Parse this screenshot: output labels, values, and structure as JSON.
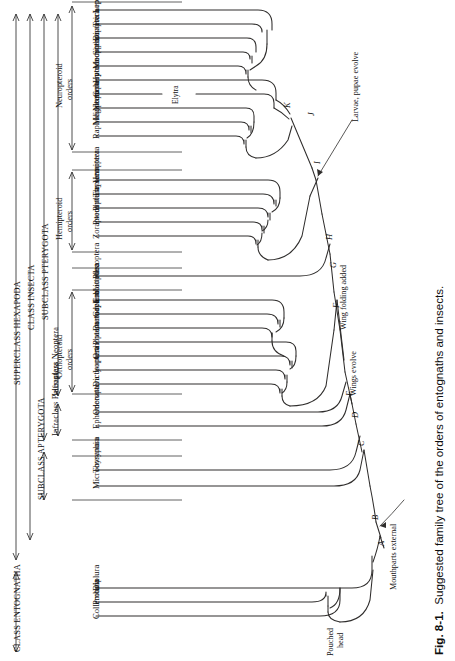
{
  "figure": {
    "label": "Fig. 8-1.",
    "caption": "Suggested family tree of the orders of entognaths and insects.",
    "caption_full": "Fig. 8-1.  Suggested family tree of the orders of entognaths and insects."
  },
  "diagram": {
    "type": "phylogenetic-tree",
    "orientation": "tips-at-left, root-at-bottom-right",
    "line_color": "#2b2b2b",
    "background": "#ffffff"
  },
  "taxonomy_brackets": [
    {
      "id": "superclass-hexapoda",
      "label": "SUPERCLASS HEXAPODA",
      "level": "superclass",
      "column": 1
    },
    {
      "id": "class-insecta",
      "label": "CLASS INSECTA",
      "level": "class",
      "column": 2
    },
    {
      "id": "subclass-pterygota",
      "label": "SUBCLASS PTERYGOTA",
      "level": "subclass",
      "column": 3
    },
    {
      "id": "subclass-apterygota",
      "label": "SUBCLASS APTERYGOTA",
      "level": "subclass",
      "column": 3,
      "two_line": true
    },
    {
      "id": "class-entognatha",
      "label": "CLASS ENTOGNATHA",
      "level": "class",
      "column": 1
    },
    {
      "id": "infraclass-neoptera",
      "label": "Infraclass Neoptera",
      "level": "infraclass",
      "column": 4,
      "two_line": true
    },
    {
      "id": "infraclass-paleoptera",
      "label": "Infraclass Paleoptera",
      "level": "infraclass",
      "column": 4,
      "two_line": true
    }
  ],
  "group_brackets": [
    {
      "id": "neuropteroid-orders",
      "label": "Neuropteroid orders",
      "line1": "Neuropteroid",
      "line2": "orders"
    },
    {
      "id": "hemipteroid-orders",
      "label": "Hemipteroid orders",
      "line1": "Hemipteroid",
      "line2": "orders"
    },
    {
      "id": "orthopteroid-orders",
      "label": "Orthopteroid orders",
      "line1": "Orthopteroid",
      "line2": "orders"
    }
  ],
  "orders": [
    {
      "name": "Lepidoptera",
      "group": "neuropteroid"
    },
    {
      "name": "Trichoptera",
      "group": "neuropteroid"
    },
    {
      "name": "Diptera",
      "group": "neuropteroid"
    },
    {
      "name": "Siphonaptera",
      "group": "neuropteroid"
    },
    {
      "name": "Mecoptera",
      "group": "neuropteroid"
    },
    {
      "name": "Hymenoptera",
      "group": "neuropteroid"
    },
    {
      "name": "Coleoptera",
      "group": "neuropteroid"
    },
    {
      "name": "Neuroptera",
      "group": "neuropteroid"
    },
    {
      "name": "Megaloptera",
      "group": "neuropteroid"
    },
    {
      "name": "Raphidioptera",
      "group": "neuropteroid"
    },
    {
      "name": "Hemiptera",
      "group": "hemipteroid"
    },
    {
      "name": "Thysanoptera",
      "group": "hemipteroid"
    },
    {
      "name": "Phthiraptera",
      "group": "hemipteroid"
    },
    {
      "name": "Psocoptera",
      "group": "hemipteroid"
    },
    {
      "name": "Zoraptera",
      "group": "hemipteroid"
    },
    {
      "name": "Plecoptera",
      "group": "neoptera-other"
    },
    {
      "name": "Embioptera",
      "group": "orthopteroid"
    },
    {
      "name": "Grylloblattodea",
      "group": "orthopteroid"
    },
    {
      "name": "Dermaptera",
      "group": "orthopteroid"
    },
    {
      "name": "Phasmatodea",
      "group": "orthopteroid"
    },
    {
      "name": "Orthoptera",
      "group": "orthopteroid"
    },
    {
      "name": "Isoptera",
      "group": "orthopteroid"
    },
    {
      "name": "Dictyoptera",
      "group": "orthopteroid"
    },
    {
      "name": "Odonata",
      "group": "paleoptera"
    },
    {
      "name": "Ephemeroptera",
      "group": "paleoptera"
    },
    {
      "name": "Thysanura",
      "group": "apterygota"
    },
    {
      "name": "Microcoryphia",
      "group": "apterygota"
    },
    {
      "name": "Diplura",
      "group": "entognatha"
    },
    {
      "name": "Protura",
      "group": "entognatha"
    },
    {
      "name": "Collembola",
      "group": "entognatha"
    }
  ],
  "nodes": [
    {
      "id": "A",
      "label": "A"
    },
    {
      "id": "B",
      "label": "B"
    },
    {
      "id": "C",
      "label": "C"
    },
    {
      "id": "D",
      "label": "D"
    },
    {
      "id": "E",
      "label": "E"
    },
    {
      "id": "F",
      "label": "F"
    },
    {
      "id": "G",
      "label": "G"
    },
    {
      "id": "H",
      "label": "H"
    },
    {
      "id": "I",
      "label": "I"
    },
    {
      "id": "J",
      "label": "J"
    },
    {
      "id": "K",
      "label": "K"
    }
  ],
  "annotations": [
    {
      "id": "pouched-head",
      "text": "Pouched head",
      "line1": "Pouched",
      "line2": "head",
      "node": "A"
    },
    {
      "id": "mouthparts-external",
      "text": "Mouthparts external",
      "node": "B"
    },
    {
      "id": "wings-evolve",
      "text": "Wings evolve",
      "node": "C"
    },
    {
      "id": "wing-folding-added",
      "text": "Wing folding added",
      "node": "E"
    },
    {
      "id": "larvae-pupae-evolve",
      "text": "Larvae, pupae evolve",
      "node": "J"
    },
    {
      "id": "elytra",
      "text": "Elytra",
      "branch": "Coleoptera"
    }
  ]
}
